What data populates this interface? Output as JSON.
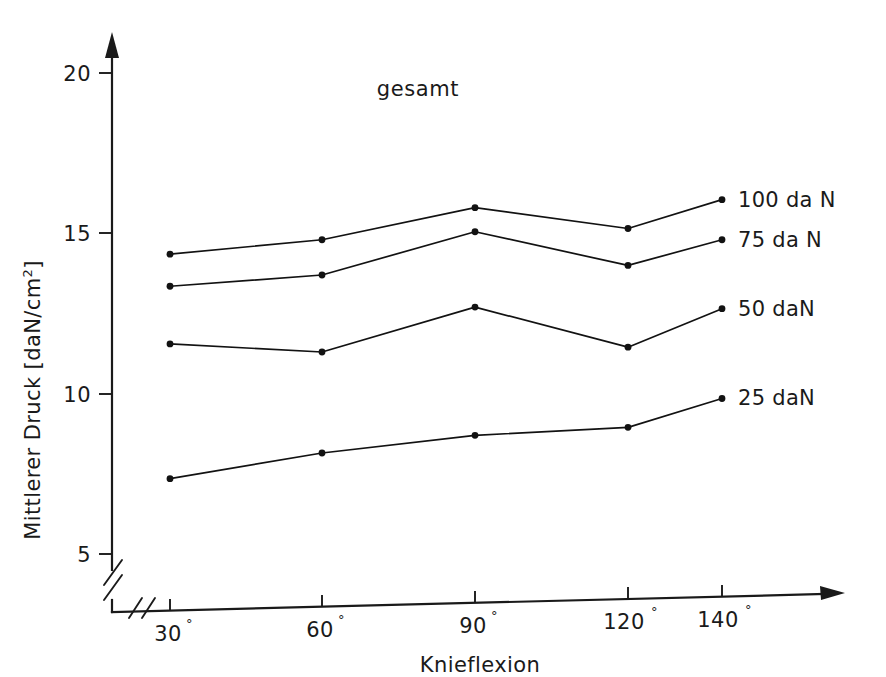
{
  "chart_data": {
    "type": "line",
    "title": "gesamt",
    "xlabel": "Knieflexion",
    "ylabel": "Mittlerer Druck [daN/cm²]",
    "ylabel_base": "Mittlerer Druck [daN/cm",
    "ylabel_sup": "2",
    "ylabel_tail": "]",
    "categories": [
      "30°",
      "60°",
      "90°",
      "120°",
      "140°"
    ],
    "category_values": [
      30,
      60,
      90,
      120,
      140
    ],
    "x_tick_labels": [
      {
        "num": "30",
        "deg": "°"
      },
      {
        "num": "60",
        "deg": "°"
      },
      {
        "num": "90",
        "deg": "°"
      },
      {
        "num": "120",
        "deg": "°"
      },
      {
        "num": "140",
        "deg": "°"
      }
    ],
    "ylim": [
      5,
      20
    ],
    "y_ticks": [
      5,
      10,
      15,
      20
    ],
    "y_tick_labels": [
      "5",
      "10",
      "15",
      "20"
    ],
    "y_axis_broken": true,
    "x_axis_broken": true,
    "grid": false,
    "legend_position": "right-inline-labels",
    "series": [
      {
        "name": "100 daN",
        "label": "100 da N",
        "values": [
          14.35,
          14.8,
          15.8,
          15.15,
          16.05
        ]
      },
      {
        "name": "75 daN",
        "label": "75 da N",
        "values": [
          13.35,
          13.7,
          15.05,
          14.0,
          14.8
        ]
      },
      {
        "name": "50 daN",
        "label": "50 daN",
        "values": [
          11.55,
          11.3,
          12.7,
          11.45,
          12.65
        ]
      },
      {
        "name": "25 daN",
        "label": "25 daN",
        "values": [
          7.35,
          8.15,
          8.7,
          8.95,
          9.85
        ]
      }
    ],
    "colors": {
      "line": "#121212",
      "axis": "#1a1a1a",
      "background": "#ffffff"
    }
  }
}
